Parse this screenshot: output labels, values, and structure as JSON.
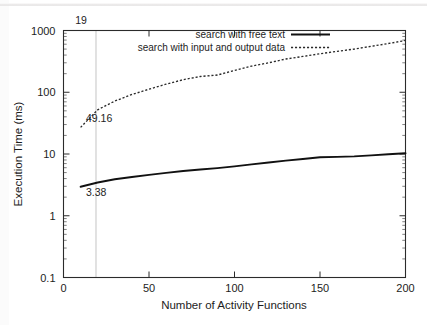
{
  "chart_data": {
    "type": "line",
    "title": "",
    "xlabel": "Number of Activity Functions",
    "ylabel": "Execution Time (ms)",
    "xlim": [
      0,
      200
    ],
    "ylim": [
      0.1,
      1000
    ],
    "yscale": "log",
    "xscale": "linear",
    "grid": false,
    "legend_position": "top-center",
    "xticks": [
      "0",
      "50",
      "100",
      "150",
      "200"
    ],
    "xtick_values": [
      0,
      50,
      100,
      150,
      200
    ],
    "yticks": [
      "0.1",
      "1",
      "10",
      "100",
      "1000"
    ],
    "ytick_values": [
      0.1,
      1,
      10,
      100,
      1000
    ],
    "x": [
      10,
      20,
      30,
      40,
      50,
      60,
      70,
      80,
      90,
      100,
      110,
      120,
      130,
      140,
      150,
      160,
      170,
      180,
      190,
      200
    ],
    "series": [
      {
        "name": "search with free text",
        "style": "solid",
        "color": "#111111",
        "values": [
          2.95,
          3.45,
          3.9,
          4.25,
          4.6,
          4.95,
          5.3,
          5.6,
          5.9,
          6.3,
          6.8,
          7.3,
          7.8,
          8.3,
          8.85,
          9.0,
          9.15,
          9.5,
          9.9,
          10.3
        ]
      },
      {
        "name": "search with input and output data",
        "style": "dotted",
        "color": "#2a2a2a",
        "values": [
          27.0,
          52.0,
          72.0,
          92.0,
          112.0,
          135.0,
          160.0,
          180.0,
          190.0,
          225.0,
          265.0,
          300.0,
          345.0,
          380.0,
          420.0,
          460.0,
          500.0,
          555.0,
          615.0,
          690.0
        ]
      }
    ],
    "annotations": [
      {
        "name": "x-marker-label",
        "text": "19",
        "x": 19,
        "position": "top-axis"
      },
      {
        "name": "dotted-series-value",
        "text": "49.16",
        "x": 19,
        "y": 49.16
      },
      {
        "name": "solid-series-value",
        "text": "3.38",
        "x": 19,
        "y": 3.38
      }
    ],
    "marker_lines": [
      {
        "name": "vertical-marker-19",
        "x": 19,
        "color": "#b5b5b5"
      }
    ]
  }
}
